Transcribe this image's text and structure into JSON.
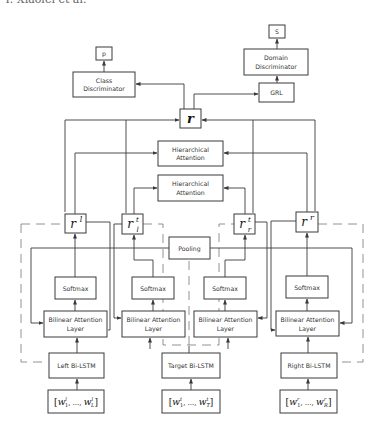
{
  "header": {
    "text": "Y. Xiaolei et al."
  },
  "diagram": {
    "outputs": {
      "p": "p",
      "s": "S"
    },
    "class_discriminator": [
      "Class",
      "Discriminator"
    ],
    "domain_discriminator": [
      "Domain",
      "Discriminator"
    ],
    "grl": "GRL",
    "r": "r",
    "hierarchical_attention_top": [
      "Hierarchical",
      "Attention"
    ],
    "hierarchical_attention_bottom": [
      "Hierarchical",
      "Attention"
    ],
    "pooling": "Pooling",
    "reps": {
      "rl": {
        "base": "r",
        "sup": "l",
        "sub": ""
      },
      "rlt": {
        "base": "r",
        "sup": "t",
        "sub": "l"
      },
      "rrt": {
        "base": "r",
        "sup": "t",
        "sub": "r"
      },
      "rr": {
        "base": "r",
        "sup": "r",
        "sub": ""
      }
    },
    "softmax": [
      "Softmax",
      "Softmax",
      "Softmax",
      "Softmax"
    ],
    "bilinear": [
      [
        "Bilinear Attention",
        "Layer"
      ],
      [
        "Bilinear Attention",
        "Layer"
      ],
      [
        "Bilinear Attention",
        "Layer"
      ],
      [
        "Bilinear Attention",
        "Layer"
      ]
    ],
    "lstm": [
      "Left Bi-LSTM",
      "Target Bi-LSTM",
      "Right Bi-LSTM"
    ],
    "inputs": [
      {
        "open": "[",
        "w1": "w",
        "w1sup": "l",
        "w1sub": "1",
        "dots": ", ..., ",
        "wn": "w",
        "wnsup": "l",
        "wnsub": "L",
        "close": "]"
      },
      {
        "open": "[",
        "w1": "w",
        "w1sup": "t",
        "w1sub": "1",
        "dots": ", ..., ",
        "wn": "w",
        "wnsup": "t",
        "wnsub": "T",
        "close": "]"
      },
      {
        "open": "[",
        "w1": "w",
        "w1sup": "r",
        "w1sub": "1",
        "dots": ", ..., ",
        "wn": "w",
        "wnsup": "r",
        "wnsub": "R",
        "close": "]"
      }
    ]
  }
}
